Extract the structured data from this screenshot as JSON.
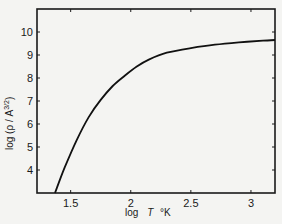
{
  "chart_data": {
    "type": "line",
    "title": "",
    "xlabel": "log  T °K",
    "ylabel": "log (ρ / A^3/2)",
    "xlim": [
      1.22,
      3.2
    ],
    "ylim": [
      3,
      11
    ],
    "grid": false,
    "legend": null,
    "x_ticks": [
      1.5,
      2,
      2.5,
      3
    ],
    "x_tick_labels": [
      "1.5",
      "2",
      "2.5",
      "3"
    ],
    "y_ticks": [
      4,
      5,
      6,
      7,
      8,
      9,
      10
    ],
    "y_tick_labels": [
      "4",
      "5",
      "6",
      "7",
      "8",
      "9",
      "10"
    ],
    "series": [
      {
        "name": "log(ρ/A^3/2) vs log T",
        "x": [
          1.37,
          1.45,
          1.55,
          1.65,
          1.75,
          1.85,
          1.95,
          2.05,
          2.15,
          2.3,
          2.5,
          2.7,
          2.9,
          3.1,
          3.2
        ],
        "y": [
          3.0,
          4.1,
          5.3,
          6.3,
          7.05,
          7.65,
          8.1,
          8.5,
          8.8,
          9.1,
          9.3,
          9.45,
          9.55,
          9.62,
          9.65
        ]
      }
    ]
  },
  "labels": {
    "xlabel_log": "log",
    "xlabel_T": "T",
    "xlabel_unit": "°K",
    "ylabel_text": "log (ρ / A",
    "ylabel_exp": "3/2",
    "ylabel_close": ")"
  }
}
